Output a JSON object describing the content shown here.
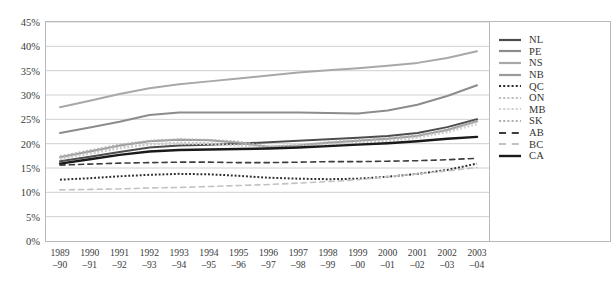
{
  "chart_data": {
    "type": "line",
    "title": "",
    "xlabel": "",
    "ylabel": "",
    "ylim": [
      0,
      45
    ],
    "ytick_values": [
      0,
      5,
      10,
      15,
      20,
      25,
      30,
      35,
      40,
      45
    ],
    "ytick_labels": [
      "0%",
      "5%",
      "10%",
      "15%",
      "20%",
      "25%",
      "30%",
      "35%",
      "40%",
      "45%"
    ],
    "grid": true,
    "legend_position": "right",
    "categories": [
      "1989–90",
      "1990–91",
      "1991–92",
      "1992–93",
      "1993–94",
      "1994–95",
      "1995–96",
      "1996–97",
      "1997–98",
      "1998–99",
      "1999–00",
      "2000–01",
      "2001–02",
      "2002–03",
      "2003–04"
    ],
    "x_tick_top": [
      "1989",
      "1990",
      "1991",
      "1992",
      "1993",
      "1994",
      "1995",
      "1996",
      "1997",
      "1998",
      "1999",
      "2000",
      "2001",
      "2002",
      "2003"
    ],
    "x_tick_bottom": [
      "–90",
      "–91",
      "–92",
      "–93",
      "–94",
      "–95",
      "–96",
      "–97",
      "–98",
      "–99",
      "–00",
      "–01",
      "–02",
      "–03",
      "–04"
    ],
    "series": [
      {
        "name": "NL",
        "color": "#4d4d4d",
        "style": "solid",
        "width": 2.0,
        "values": [
          16.4,
          17.3,
          18.3,
          19.2,
          19.6,
          19.8,
          20.0,
          20.3,
          20.6,
          20.9,
          21.2,
          21.6,
          22.2,
          23.4,
          25.0
        ]
      },
      {
        "name": "PE",
        "color": "#8c8c8c",
        "style": "solid",
        "width": 2.0,
        "values": [
          22.2,
          23.3,
          24.5,
          25.9,
          26.4,
          26.4,
          26.4,
          26.4,
          26.4,
          26.3,
          26.2,
          26.8,
          28.0,
          29.8,
          32.0
        ]
      },
      {
        "name": "NS",
        "color": "#a8a8a8",
        "style": "solid",
        "width": 2.0,
        "values": [
          27.5,
          28.8,
          30.2,
          31.4,
          32.2,
          32.8,
          33.4,
          34.0,
          34.6,
          35.1,
          35.5,
          36.0,
          36.6,
          37.6,
          39.0
        ]
      },
      {
        "name": "NB",
        "color": "#9a9a9a",
        "style": "solid",
        "width": 2.0,
        "values": [
          17.2,
          18.4,
          19.6,
          20.5,
          20.8,
          20.7,
          20.2,
          19.3,
          19.6,
          20.2,
          20.6,
          21.0,
          21.6,
          22.8,
          24.6
        ]
      },
      {
        "name": "QC",
        "color": "#2e2e2e",
        "style": "dotted",
        "width": 2.0,
        "values": [
          12.6,
          12.9,
          13.3,
          13.6,
          13.8,
          13.7,
          13.4,
          13.0,
          12.8,
          12.7,
          12.8,
          13.2,
          13.8,
          14.6,
          15.9
        ]
      },
      {
        "name": "ON",
        "color": "#bdbdbd",
        "style": "dotted",
        "width": 2.0,
        "values": [
          17.0,
          18.1,
          19.2,
          19.9,
          20.2,
          20.1,
          19.7,
          19.5,
          19.6,
          19.9,
          20.2,
          20.7,
          21.4,
          22.6,
          24.5
        ]
      },
      {
        "name": "MB",
        "color": "#d0d0d0",
        "style": "dotted",
        "width": 2.0,
        "values": [
          16.8,
          17.9,
          19.0,
          19.8,
          20.0,
          19.9,
          19.6,
          19.4,
          19.5,
          19.8,
          20.1,
          20.5,
          21.2,
          22.3,
          24.0
        ]
      },
      {
        "name": "SK",
        "color": "#b0b0b0",
        "style": "dotted",
        "width": 2.0,
        "values": [
          17.4,
          18.6,
          19.8,
          20.6,
          20.9,
          20.8,
          20.4,
          19.4,
          19.7,
          20.3,
          20.7,
          21.1,
          21.7,
          22.9,
          24.7
        ]
      },
      {
        "name": "AB",
        "color": "#3d3d3d",
        "style": "dashed",
        "width": 1.6,
        "values": [
          15.6,
          15.8,
          16.0,
          16.1,
          16.2,
          16.2,
          16.1,
          16.1,
          16.2,
          16.3,
          16.3,
          16.4,
          16.5,
          16.7,
          17.0
        ]
      },
      {
        "name": "BC",
        "color": "#c2c2c2",
        "style": "dashed",
        "width": 1.6,
        "values": [
          10.5,
          10.6,
          10.7,
          10.9,
          11.0,
          11.2,
          11.4,
          11.6,
          11.9,
          12.2,
          12.6,
          13.2,
          13.8,
          14.4,
          15.1
        ]
      },
      {
        "name": "CA",
        "color": "#1a1a1a",
        "style": "solid",
        "width": 2.4,
        "values": [
          15.9,
          16.8,
          17.7,
          18.4,
          18.7,
          18.8,
          18.9,
          19.0,
          19.2,
          19.5,
          19.8,
          20.1,
          20.5,
          21.0,
          21.4
        ]
      }
    ]
  }
}
